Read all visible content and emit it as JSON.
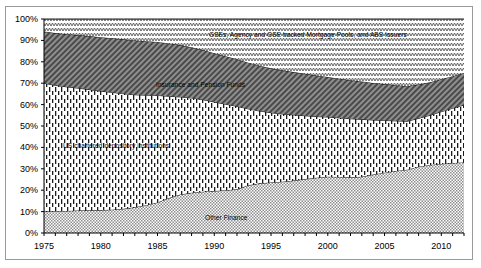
{
  "chart_data": {
    "type": "area",
    "stacked": true,
    "title": "",
    "subtitle": "",
    "xlabel": "",
    "ylabel": "",
    "xlim": [
      1975,
      2012
    ],
    "ylim": [
      0,
      100
    ],
    "grid": false,
    "legend_position": "inline-annotations",
    "y_tick_labels": [
      "0%",
      "10%",
      "20%",
      "30%",
      "40%",
      "50%",
      "60%",
      "70%",
      "80%",
      "90%",
      "100%"
    ],
    "y_tick_values": [
      0,
      10,
      20,
      30,
      40,
      50,
      60,
      70,
      80,
      90,
      100
    ],
    "x_tick_labels": [
      "1975",
      "1980",
      "1985",
      "1990",
      "1995",
      "2000",
      "2005",
      "2010"
    ],
    "x_tick_values": [
      1975,
      1980,
      1985,
      1990,
      1995,
      2000,
      2005,
      2010
    ],
    "x": [
      1975,
      1976,
      1977,
      1978,
      1979,
      1980,
      1981,
      1982,
      1983,
      1984,
      1985,
      1986,
      1987,
      1988,
      1989,
      1990,
      1991,
      1992,
      1993,
      1994,
      1995,
      1996,
      1997,
      1998,
      1999,
      2000,
      2001,
      2002,
      2003,
      2004,
      2005,
      2006,
      2007,
      2008,
      2009,
      2010,
      2011,
      2012
    ],
    "series": [
      {
        "name": "Other Finance",
        "label": "Other Finance",
        "pattern": "fine-checker",
        "fill": "#c9c9c9",
        "values": [
          10.0,
          10.2,
          10.3,
          10.5,
          10.6,
          10.7,
          10.9,
          11.3,
          12.0,
          13.0,
          14.3,
          16.3,
          18.0,
          18.8,
          19.3,
          19.6,
          20.0,
          20.4,
          22.3,
          23.2,
          23.6,
          24.0,
          24.5,
          25.2,
          25.8,
          26.3,
          26.2,
          26.0,
          26.3,
          27.3,
          28.2,
          29.0,
          29.6,
          31.0,
          31.8,
          32.3,
          32.7,
          33.0
        ]
      },
      {
        "name": "US chartered depository institutions",
        "label": "US chartered depository institutions",
        "pattern": "vertical-dash",
        "fill": "#ffffff",
        "values": [
          60.0,
          58.8,
          58.0,
          57.2,
          56.4,
          55.6,
          54.8,
          53.8,
          52.6,
          51.4,
          50.0,
          47.6,
          45.6,
          44.3,
          43.0,
          41.6,
          40.2,
          38.8,
          35.7,
          33.8,
          32.6,
          31.6,
          30.7,
          29.6,
          28.6,
          27.9,
          27.6,
          27.4,
          26.8,
          25.5,
          24.4,
          23.4,
          22.6,
          22.6,
          23.2,
          24.4,
          25.6,
          26.8
        ]
      },
      {
        "name": "Insurance and Pension Funds",
        "label": "Insurance and Pension Funds",
        "pattern": "diagonal-hatch",
        "fill": "#9e9e9e",
        "values": [
          24.2,
          24.4,
          24.6,
          24.8,
          25.0,
          25.2,
          25.3,
          25.4,
          25.4,
          25.2,
          25.0,
          24.7,
          24.2,
          23.7,
          23.2,
          22.8,
          22.4,
          22.0,
          21.6,
          21.2,
          20.8,
          20.4,
          20.0,
          19.6,
          19.2,
          18.7,
          18.3,
          18.0,
          17.7,
          17.3,
          17.0,
          16.7,
          16.4,
          15.8,
          15.4,
          15.2,
          15.0,
          15.0
        ]
      },
      {
        "name": "GSEs, Agency and GSE backed Mortgage Pools, and ABS Issuers",
        "label": "GSEs, Agency and GSE backed Mortgage Pools, and ABS Issuers",
        "pattern": "zigzag",
        "fill": "#ffffff",
        "values": [
          5.8,
          6.6,
          7.1,
          7.5,
          8.0,
          8.5,
          9.0,
          9.5,
          10.0,
          10.4,
          10.7,
          11.4,
          12.2,
          13.2,
          14.5,
          16.0,
          17.4,
          18.8,
          20.4,
          21.8,
          23.0,
          24.0,
          24.8,
          25.6,
          26.4,
          27.1,
          27.9,
          28.6,
          29.2,
          29.9,
          30.4,
          30.9,
          31.4,
          30.6,
          29.6,
          28.1,
          26.7,
          25.2
        ]
      }
    ],
    "annotations": [
      {
        "text": "GSEs, Agency and GSE backed Mortgage Pools, and ABS Issuers",
        "series": "GSEs, Agency and GSE backed Mortgage Pools, and ABS Issuers"
      },
      {
        "text": "Insurance and Pension Funds",
        "series": "Insurance and Pension Funds"
      },
      {
        "text": "US chartered depository institutions",
        "series": "US chartered depository institutions"
      },
      {
        "text": "Other Finance",
        "series": "Other Finance"
      }
    ]
  },
  "colors": {
    "frame_border": "#9a9a9a",
    "axis": "#000000",
    "background": "#ffffff",
    "other_finance_fill": "#c9c9c9",
    "insurance_fill": "#9e9e9e",
    "depository_fill": "#ffffff",
    "gse_fill": "#ffffff"
  }
}
